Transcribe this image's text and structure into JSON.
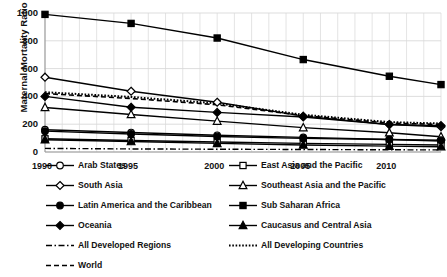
{
  "chart_data": {
    "type": "line",
    "title": "",
    "xlabel": "",
    "ylabel": "Maternal Mortality Ratio",
    "x": [
      1990,
      1995,
      2000,
      2005,
      2010,
      2013
    ],
    "xticks": [
      "1990",
      "1995",
      "2000",
      "2005",
      "2010"
    ],
    "xtick_values": [
      1990,
      1995,
      2000,
      2005,
      2010
    ],
    "yticks": [
      "0",
      "200",
      "400",
      "600",
      "800",
      "1000"
    ],
    "ytick_values": [
      0,
      200,
      400,
      600,
      800,
      1000
    ],
    "ylim": [
      0,
      1000
    ],
    "xlim": [
      1990,
      2013
    ],
    "grid": "both",
    "legend_position": "bottom",
    "series": [
      {
        "name": "Arab States",
        "marker": "circle-open",
        "line": "solid",
        "values": [
          160,
          140,
          120,
          105,
          90,
          78
        ]
      },
      {
        "name": "East Asia and the Pacific",
        "marker": "square-open",
        "line": "solid",
        "values": [
          95,
          83,
          72,
          62,
          55,
          50
        ]
      },
      {
        "name": "South Asia",
        "marker": "diamond-open",
        "line": "solid",
        "values": [
          538,
          437,
          358,
          258,
          197,
          182
        ]
      },
      {
        "name": "Southeast Asia and the Pacific",
        "marker": "triangle-open",
        "line": "solid",
        "values": [
          320,
          270,
          222,
          175,
          138,
          110
        ]
      },
      {
        "name": "Latin America and the Caribbean",
        "marker": "circle-filled",
        "line": "solid",
        "values": [
          150,
          130,
          112,
          98,
          90,
          85
        ]
      },
      {
        "name": "Sub Saharan Africa",
        "marker": "square-filled",
        "line": "solid",
        "values": [
          990,
          925,
          820,
          665,
          545,
          485
        ]
      },
      {
        "name": "Oceania",
        "marker": "diamond-filled",
        "line": "solid",
        "values": [
          400,
          322,
          285,
          252,
          198,
          190
        ]
      },
      {
        "name": "Caucasus and Central Asia",
        "marker": "triangle-filled",
        "line": "solid",
        "values": [
          88,
          75,
          62,
          50,
          42,
          38
        ]
      },
      {
        "name": "All Developed Regions",
        "marker": "none",
        "line": "dashdot",
        "values": [
          26,
          22,
          20,
          18,
          16,
          15
        ]
      },
      {
        "name": "All Developing Countries",
        "marker": "none",
        "line": "dotted",
        "values": [
          430,
          396,
          350,
          268,
          215,
          205
        ]
      },
      {
        "name": "World",
        "marker": "none",
        "line": "dashed",
        "values": [
          420,
          385,
          340,
          262,
          208,
          198
        ]
      }
    ]
  },
  "legend": {
    "items": [
      {
        "label": "Arab States",
        "marker": "circle-open",
        "line": "solid"
      },
      {
        "label": "East Asia and the Pacific",
        "marker": "square-open",
        "line": "solid"
      },
      {
        "label": "South Asia",
        "marker": "diamond-open",
        "line": "solid"
      },
      {
        "label": "Southeast Asia and the Pacific",
        "marker": "triangle-open",
        "line": "solid"
      },
      {
        "label": "Latin America and the Caribbean",
        "marker": "circle-filled",
        "line": "solid"
      },
      {
        "label": "Sub Saharan Africa",
        "marker": "square-filled",
        "line": "solid"
      },
      {
        "label": "Oceania",
        "marker": "diamond-filled",
        "line": "solid"
      },
      {
        "label": "Caucasus and Central Asia",
        "marker": "triangle-filled",
        "line": "solid"
      },
      {
        "label": "All Developed Regions",
        "marker": "none",
        "line": "dashdot"
      },
      {
        "label": "All Developing Countries",
        "marker": "none",
        "line": "dotted"
      },
      {
        "label": "World",
        "marker": "none",
        "line": "dashed"
      }
    ]
  },
  "colors": {
    "line": "#000000",
    "grid": "#d9d9d9",
    "axis": "#bfbfbf",
    "background": "#ffffff",
    "text": "#111111"
  }
}
